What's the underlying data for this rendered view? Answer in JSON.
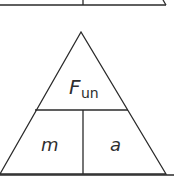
{
  "diagram": {
    "type": "formula-triangle",
    "stroke_color": "#2a2a2a",
    "top_triangle_partial": {
      "visible": "bottom edge only"
    },
    "main_triangle": {
      "top_label": {
        "main": "F",
        "subscript": "un"
      },
      "bottom_left_label": "m",
      "bottom_right_label": "a"
    }
  }
}
